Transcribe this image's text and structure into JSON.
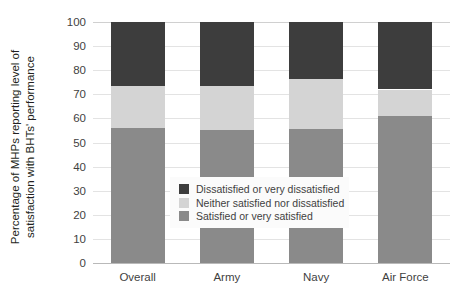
{
  "chart_data": {
    "type": "bar",
    "subtype": "stacked-bar-100",
    "title": "",
    "xlabel": "",
    "ylabel": "Percentage of MHPs reporting level of satisfaction with BHTs' performance",
    "ylabel_lines": [
      "Percentage of MHPs reporting level of",
      "satisfaction with BHTs' performance"
    ],
    "categories": [
      "Overall",
      "Army",
      "Navy",
      "Air Force"
    ],
    "ylim": [
      0,
      100
    ],
    "yticks": [
      0,
      10,
      20,
      30,
      40,
      50,
      60,
      70,
      80,
      90,
      100
    ],
    "ytick_labels": [
      "0",
      "10",
      "20",
      "30",
      "40",
      "50",
      "60",
      "70",
      "80",
      "90",
      "100"
    ],
    "grid": true,
    "legend_position": "center",
    "stack_order_bottom_to_top": [
      "Satisfied or very satisfied",
      "Neither satisfied nor dissatisfied",
      "Dissatisfied or very dissatisfied"
    ],
    "series": [
      {
        "name": "Satisfied or very satisfied",
        "color": "#8a8a8a",
        "values": [
          56,
          55,
          55.5,
          61
        ]
      },
      {
        "name": "Neither satisfied nor dissatisfied",
        "color": "#d4d4d4",
        "values": [
          17.5,
          18.5,
          21,
          11
        ]
      },
      {
        "name": "Dissatisfied or very dissatisfied",
        "color": "#3d3d3d",
        "values": [
          26.5,
          26.5,
          23.5,
          28
        ]
      }
    ]
  },
  "legend": {
    "items": [
      {
        "label": "Dissatisfied or very dissatisfied",
        "color": "#3d3d3d"
      },
      {
        "label": "Neither satisfied nor dissatisfied",
        "color": "#d4d4d4"
      },
      {
        "label": "Satisfied or very satisfied",
        "color": "#8a8a8a"
      }
    ]
  },
  "colors": {
    "gridline": "#e3e3e3",
    "axis": "#b9b9b9",
    "text": "#3f3f3f",
    "background": "#ffffff",
    "legend_background": "#fbfbfb"
  }
}
